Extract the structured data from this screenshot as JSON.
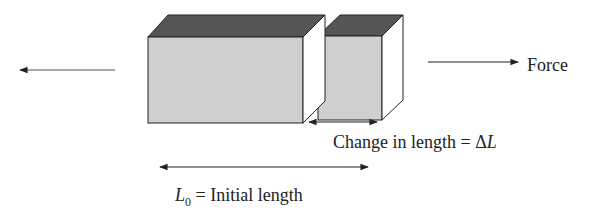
{
  "diagram": {
    "labels": {
      "force": "Force",
      "change_in_length_prefix": "Change in length = ",
      "delta_symbol": "Δ",
      "length_symbol": "L",
      "l0_symbol": "L",
      "l0_subscript": "0",
      "initial_length_suffix": " = Initial length"
    },
    "colors": {
      "front_face": "#cfcfcf",
      "top_face": "#555555",
      "side_face": "#ffffff",
      "stroke": "#222222",
      "text": "#222222"
    },
    "arrows": [
      {
        "name": "left-force-arrow",
        "direction": "left"
      },
      {
        "name": "right-force-arrow",
        "direction": "right"
      },
      {
        "name": "delta-l-arrow",
        "direction": "both"
      },
      {
        "name": "l0-arrow",
        "direction": "both"
      }
    ]
  }
}
